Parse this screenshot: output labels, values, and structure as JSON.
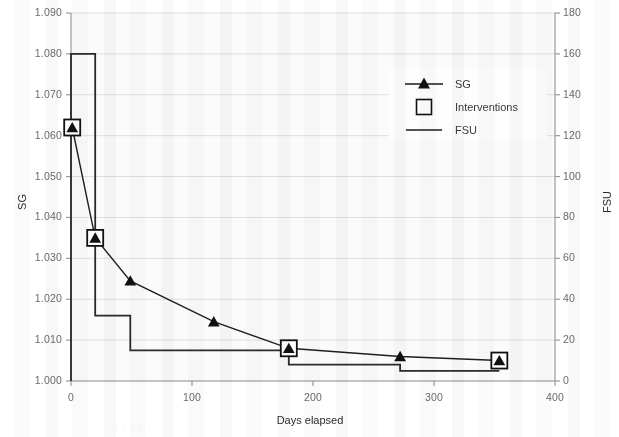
{
  "chart_data": {
    "type": "line",
    "title": "",
    "xlabel": "Days elapsed",
    "ylabel": "SG",
    "y2label": "FSU",
    "xlim": [
      0,
      400
    ],
    "ylim": [
      1.0,
      1.09
    ],
    "y2lim": [
      0,
      180
    ],
    "grid": true,
    "legend_position": "upper-right",
    "x_ticks": [
      "0",
      "100",
      "200",
      "300",
      "400"
    ],
    "x_tick_values": [
      0,
      100,
      200,
      300,
      400
    ],
    "y_ticks": [
      "1.000",
      "1.010",
      "1.020",
      "1.030",
      "1.040",
      "1.050",
      "1.060",
      "1.070",
      "1.080",
      "1.090"
    ],
    "y_tick_values": [
      1.0,
      1.01,
      1.02,
      1.03,
      1.04,
      1.05,
      1.06,
      1.07,
      1.08,
      1.09
    ],
    "y2_ticks": [
      "0",
      "20",
      "40",
      "60",
      "80",
      "100",
      "120",
      "140",
      "160",
      "180"
    ],
    "y2_tick_values": [
      0,
      20,
      40,
      60,
      80,
      100,
      120,
      140,
      160,
      180
    ],
    "series": [
      {
        "name": "SG",
        "axis": "left",
        "marker": "triangle",
        "x": [
          1,
          20,
          49,
          118,
          180,
          272,
          354
        ],
        "values": [
          1.062,
          1.035,
          1.0245,
          1.0145,
          1.008,
          1.006,
          1.005
        ]
      },
      {
        "name": "Interventions",
        "axis": "left",
        "marker": "square",
        "x": [
          1,
          20,
          180,
          354
        ],
        "values": [
          1.062,
          1.035,
          1.008,
          1.005
        ]
      },
      {
        "name": "FSU",
        "axis": "right",
        "marker": "step",
        "x": [
          0,
          20,
          49,
          180,
          272,
          354
        ],
        "values": [
          160,
          32,
          15,
          8,
          5,
          5
        ]
      }
    ]
  },
  "legend": {
    "items": [
      {
        "label": "SG",
        "key": "triangle-line-key"
      },
      {
        "label": "Interventions",
        "key": "square-key"
      },
      {
        "label": "FSU",
        "key": "line-key"
      }
    ]
  },
  "axes": {
    "x_title": "Days elapsed",
    "y_left_title": "SG",
    "y_right_title": "FSU"
  },
  "artifacts": {
    "bottom_ghost_text": "· · · · ·"
  }
}
